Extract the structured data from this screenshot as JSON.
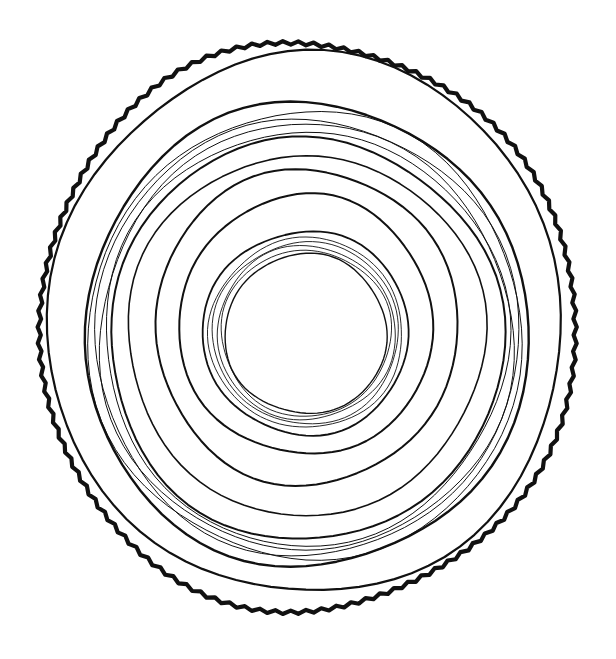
{
  "image": {
    "subject": "hand-drawn tree ring cross-section",
    "background": "#ffffff",
    "ink": "#111111",
    "center": [
      306,
      332
    ],
    "rings": [
      {
        "rx": 268,
        "ry": 284,
        "cy": 327,
        "w": 4.2,
        "bark": true
      },
      {
        "rx": 257,
        "ry": 270,
        "cy": 324,
        "w": 2.2
      },
      {
        "rx": 222,
        "ry": 232,
        "cy": 335,
        "w": 2.4
      },
      {
        "rx": 217,
        "ry": 224,
        "cy": 336,
        "w": 1.0
      },
      {
        "rx": 212,
        "ry": 218,
        "cy": 337,
        "w": 1.0
      },
      {
        "rx": 207,
        "ry": 213,
        "cy": 338,
        "w": 1.0
      },
      {
        "rx": 202,
        "ry": 207,
        "cy": 338,
        "w": 1.0
      },
      {
        "rx": 197,
        "ry": 201,
        "cy": 339,
        "w": 2.0
      },
      {
        "rx": 179,
        "ry": 180,
        "cy": 335,
        "w": 1.6
      },
      {
        "rx": 151,
        "ry": 158,
        "cy": 327,
        "w": 2.0
      },
      {
        "rx": 127,
        "ry": 130,
        "cy": 325,
        "w": 2.0
      },
      {
        "rx": 103,
        "ry": 102,
        "cy": 333,
        "w": 1.8
      },
      {
        "rx": 97,
        "ry": 95,
        "cy": 333,
        "w": 0.9
      },
      {
        "rx": 93,
        "ry": 91,
        "cy": 333,
        "w": 0.9
      },
      {
        "rx": 89,
        "ry": 87,
        "cy": 333,
        "w": 0.9
      },
      {
        "rx": 85,
        "ry": 83,
        "cy": 333,
        "w": 0.9
      },
      {
        "rx": 81,
        "ry": 80,
        "cy": 334,
        "w": 1.4
      }
    ]
  },
  "caption": "Tree ring illustration"
}
